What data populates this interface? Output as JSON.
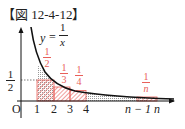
{
  "figure": {
    "title": "【図 12-4-12】",
    "curve_label": {
      "y": "y",
      "eq": "=",
      "num": "1",
      "den": "x"
    },
    "axis_labels": {
      "origin": "O",
      "half_num": "1",
      "half_den": "2"
    },
    "x_ticks": [
      "1",
      "2",
      "3",
      "4",
      "n − 1",
      "n"
    ],
    "rect_labels": [
      {
        "num": "1",
        "den": "2"
      },
      {
        "num": "1",
        "den": "3"
      },
      {
        "num": "1",
        "den": "4"
      },
      {
        "num": "1",
        "den": "n"
      }
    ],
    "colors": {
      "red": "#e8605a",
      "black": "#111111"
    }
  }
}
